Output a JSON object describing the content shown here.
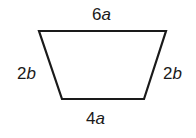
{
  "diagram": {
    "shape": "isosceles trapezoid",
    "stroke_color": "#1a1a1a",
    "vertices": [
      [
        39,
        31
      ],
      [
        166,
        31
      ],
      [
        144,
        99
      ],
      [
        62,
        99
      ]
    ],
    "labels": {
      "top": {
        "coef": "6",
        "var": "a"
      },
      "left": {
        "coef": "2",
        "var": "b"
      },
      "right": {
        "coef": "2",
        "var": "b"
      },
      "bottom": {
        "coef": "4",
        "var": "a"
      }
    }
  }
}
